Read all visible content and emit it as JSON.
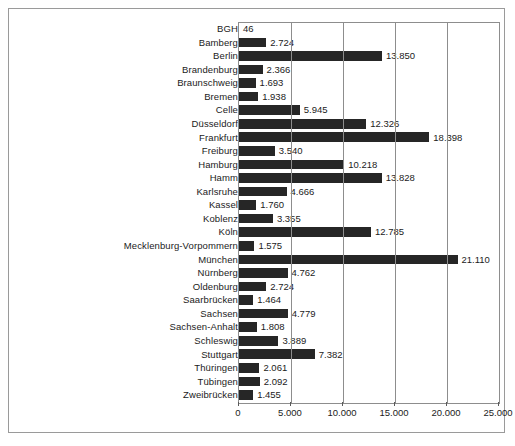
{
  "chart_data": {
    "type": "bar",
    "orientation": "horizontal",
    "title": "",
    "subtitle": "",
    "xlabel": "",
    "ylabel": "",
    "xlim": [
      0,
      25000
    ],
    "grid": true,
    "legend": false,
    "x_ticks": [
      "0",
      "5.000",
      "10.000",
      "15.000",
      "20.000",
      "25.000"
    ],
    "x_tick_values": [
      0,
      5000,
      10000,
      15000,
      20000,
      25000
    ],
    "bar_color": "#262626",
    "categories": [
      "BGH",
      "Bamberg",
      "Berlin",
      "Brandenburg",
      "Braunschweig",
      "Bremen",
      "Celle",
      "Düsseldorf",
      "Frankfurt",
      "Freiburg",
      "Hamburg",
      "Hamm",
      "Karlsruhe",
      "Kassel",
      "Koblenz",
      "Köln",
      "Mecklenburg-Vorpommern",
      "München",
      "Nürnberg",
      "Oldenburg",
      "Saarbrücken",
      "Sachsen",
      "Sachsen-Anhalt",
      "Schleswig",
      "Stuttgart",
      "Thüringen",
      "Tübingen",
      "Zweibrücken"
    ],
    "values": [
      46,
      2724,
      13850,
      2366,
      1693,
      1938,
      5945,
      12326,
      18398,
      3540,
      10218,
      13828,
      4666,
      1760,
      3355,
      12785,
      1575,
      21110,
      4762,
      2724,
      1464,
      4779,
      1808,
      3889,
      7382,
      2061,
      2092,
      1455
    ],
    "value_labels": [
      "46",
      "2.724",
      "13.850",
      "2.366",
      "1.693",
      "1.938",
      "5.945",
      "12.326",
      "18.398",
      "3.540",
      "10.218",
      "13.828",
      "4.666",
      "1.760",
      "3.355",
      "12.785",
      "1.575",
      "21.110",
      "4.762",
      "2.724",
      "1.464",
      "4.779",
      "1.808",
      "3.889",
      "7.382",
      "2.061",
      "2.092",
      "1.455"
    ]
  }
}
